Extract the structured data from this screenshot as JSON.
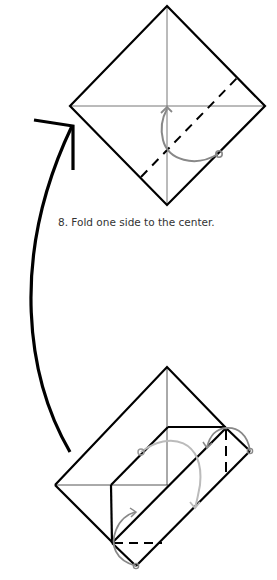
{
  "step": {
    "number": "8",
    "caption": "8. Fold one side to the center."
  },
  "colors": {
    "line": "#000000",
    "crease": "#777777",
    "arrow_gray": "#8a8a8a",
    "arrow_light": "#bbbbbb",
    "text": "#333333"
  },
  "figures": [
    {
      "name": "result-diagram-top",
      "description": "square diamond with horizontal and vertical creases, dashed valley fold line on lower-right, gray fold arrow to center"
    },
    {
      "name": "start-diagram-bottom",
      "description": "folded envelope-like base with dashed fold lines and gray fold arrows"
    }
  ],
  "transition_arrow": {
    "direction": "up",
    "from": "bottom diagram",
    "to": "top diagram"
  }
}
